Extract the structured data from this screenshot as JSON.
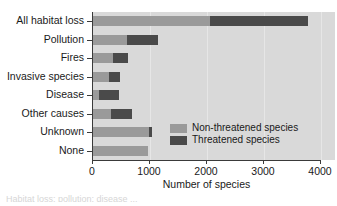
{
  "chart_data": {
    "type": "bar",
    "orientation": "horizontal",
    "stacked": true,
    "title": "",
    "xlabel": "Number of species",
    "ylabel": "",
    "xlim": [
      0,
      4000
    ],
    "xticks": [
      0,
      1000,
      2000,
      3000,
      4000
    ],
    "xtick_labels": [
      "0",
      "1000",
      "2000",
      "3000",
      "4000"
    ],
    "grid": "vertical-faint",
    "legend_position": "inside-lower-right",
    "categories": [
      "All habitat loss",
      "Pollution",
      "Fires",
      "Invasive species",
      "Disease",
      "Other causes",
      "Unknown",
      "None"
    ],
    "series": [
      {
        "name": "Non-threatened species",
        "color": "#9a9a9a",
        "values": [
          2050,
          600,
          350,
          280,
          100,
          320,
          980,
          970
        ]
      },
      {
        "name": "Threatened species",
        "color": "#4a4a4a",
        "values": [
          1720,
          540,
          270,
          190,
          350,
          370,
          50,
          0
        ]
      }
    ],
    "totals": [
      3770,
      1140,
      620,
      470,
      450,
      690,
      1030,
      970
    ]
  },
  "legend": {
    "items": [
      {
        "label": "Non-threatened species",
        "color": "#9a9a9a"
      },
      {
        "label": "Threatened species",
        "color": "#4a4a4a"
      }
    ]
  },
  "axis": {
    "x_title": "Number of species"
  },
  "artifact": {
    "text": "Habitat loss; pollution; disease ..."
  }
}
